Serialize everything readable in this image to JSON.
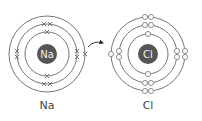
{
  "diagram": {
    "type": "bohr-model-ionic-bonding",
    "atoms": [
      {
        "id": "na",
        "symbol": "Na",
        "label": "Na",
        "center": [
          47,
          54
        ],
        "nucleus_radius": 10,
        "nucleus_color": "#555555",
        "electron_style": "cross",
        "shells": [
          {
            "radius": 22,
            "electrons": 2
          },
          {
            "radius": 30,
            "electrons": 8
          },
          {
            "radius": 38,
            "electrons": 1
          }
        ]
      },
      {
        "id": "cl",
        "symbol": "Cl",
        "label": "Cl",
        "center": [
          148,
          54
        ],
        "nucleus_radius": 10,
        "nucleus_color": "#555555",
        "electron_style": "open-circle",
        "shells": [
          {
            "radius": 20,
            "electrons": 2
          },
          {
            "radius": 29,
            "electrons": 8
          },
          {
            "radius": 37,
            "electrons": 7
          }
        ]
      }
    ],
    "arrow": {
      "from": "na outer electron",
      "to": "cl outer shell",
      "meaning": "electron transfer"
    },
    "colors": {
      "ring": "#666666",
      "nucleus": "#555555",
      "nucleus_text": "#f0f0f0",
      "electron": "#777777"
    }
  }
}
